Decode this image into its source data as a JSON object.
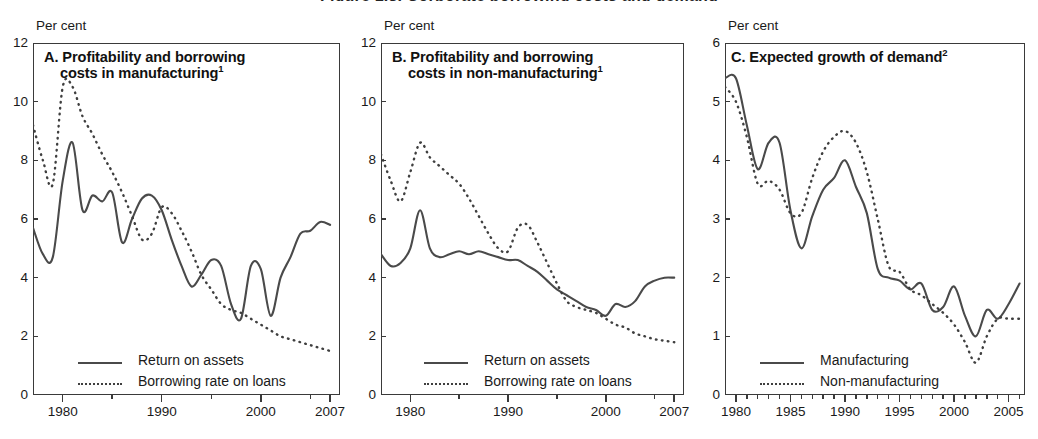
{
  "figure": {
    "cut_off_running_title": "Figure 1.8.  Corporate borrowing costs and demand",
    "units_label": "Per cent"
  },
  "panels": [
    {
      "id": "A",
      "title_line1": "A. Profitability and borrowing",
      "title_line2": "costs in manufacturing",
      "title_superscript": "1",
      "units": "Per cent",
      "y_ticks": [
        "0",
        "2",
        "4",
        "6",
        "8",
        "10",
        "12"
      ],
      "x_ticks": [
        "1980",
        "1990",
        "2000",
        "2007"
      ],
      "legend": [
        {
          "key": "solid",
          "label": "Return on assets"
        },
        {
          "key": "dotted",
          "label": "Borrowing rate on loans"
        }
      ]
    },
    {
      "id": "B",
      "title_line1": "B. Profitability and borrowing",
      "title_line2": "costs in non-manufacturing",
      "title_superscript": "1",
      "units": "Per cent",
      "y_ticks": [
        "0",
        "2",
        "4",
        "6",
        "8",
        "10",
        "12"
      ],
      "x_ticks": [
        "1980",
        "1990",
        "2000",
        "2007"
      ],
      "legend": [
        {
          "key": "solid",
          "label": "Return on assets"
        },
        {
          "key": "dotted",
          "label": "Borrowing rate on loans"
        }
      ]
    },
    {
      "id": "C",
      "title_line1": "C. Expected growth of demand",
      "title_line2": "",
      "title_superscript": "2",
      "units": "Per cent",
      "y_ticks": [
        "0",
        "1",
        "2",
        "3",
        "4",
        "5",
        "6"
      ],
      "x_ticks": [
        "1980",
        "1985",
        "1990",
        "1995",
        "2000",
        "2005"
      ],
      "legend": [
        {
          "key": "solid",
          "label": "Manufacturing"
        },
        {
          "key": "dotted",
          "label": "Non-manufacturing"
        }
      ]
    }
  ],
  "chart_data": [
    {
      "type": "line",
      "panel": "A",
      "title": "A. Profitability and borrowing costs in manufacturing",
      "xlabel": "",
      "ylabel": "Per cent",
      "ylim": [
        0,
        12
      ],
      "xlim": [
        1977,
        2008
      ],
      "grid": false,
      "legend_position": "bottom-left",
      "x": [
        1977,
        1978,
        1979,
        1980,
        1981,
        1982,
        1983,
        1984,
        1985,
        1986,
        1987,
        1988,
        1989,
        1990,
        1991,
        1992,
        1993,
        1994,
        1995,
        1996,
        1997,
        1998,
        1999,
        2000,
        2001,
        2002,
        2003,
        2004,
        2005,
        2006,
        2007
      ],
      "series": [
        {
          "name": "Return on assets",
          "style": "solid",
          "values": [
            5.7,
            4.8,
            4.7,
            7.3,
            8.6,
            6.3,
            6.8,
            6.6,
            6.9,
            5.2,
            6.0,
            6.7,
            6.8,
            6.3,
            5.3,
            4.4,
            3.7,
            4.1,
            4.6,
            4.4,
            3.1,
            2.6,
            4.4,
            4.3,
            2.7,
            4.0,
            4.7,
            5.5,
            5.6,
            5.9,
            5.8
          ]
        },
        {
          "name": "Borrowing rate on loans",
          "style": "dotted",
          "values": [
            9.2,
            8.0,
            7.2,
            10.5,
            10.5,
            9.5,
            8.9,
            8.2,
            7.6,
            6.9,
            6.1,
            5.3,
            5.5,
            6.4,
            6.2,
            5.6,
            4.9,
            4.1,
            3.6,
            3.1,
            2.9,
            2.8,
            2.6,
            2.4,
            2.2,
            2.0,
            1.9,
            1.8,
            1.7,
            1.6,
            1.5
          ]
        }
      ]
    },
    {
      "type": "line",
      "panel": "B",
      "title": "B. Profitability and borrowing costs in non-manufacturing",
      "xlabel": "",
      "ylabel": "Per cent",
      "ylim": [
        0,
        12
      ],
      "xlim": [
        1977,
        2008
      ],
      "grid": false,
      "legend_position": "bottom-left",
      "x": [
        1977,
        1978,
        1979,
        1980,
        1981,
        1982,
        1983,
        1984,
        1985,
        1986,
        1987,
        1988,
        1989,
        1990,
        1991,
        1992,
        1993,
        1994,
        1995,
        1996,
        1997,
        1998,
        1999,
        2000,
        2001,
        2002,
        2003,
        2004,
        2005,
        2006,
        2007
      ],
      "series": [
        {
          "name": "Return on assets",
          "style": "solid",
          "values": [
            4.8,
            4.4,
            4.5,
            5.0,
            6.3,
            5.0,
            4.7,
            4.8,
            4.9,
            4.8,
            4.9,
            4.8,
            4.7,
            4.6,
            4.6,
            4.4,
            4.2,
            3.9,
            3.6,
            3.4,
            3.2,
            3.0,
            2.9,
            2.7,
            3.1,
            3.0,
            3.2,
            3.7,
            3.9,
            4.0,
            4.0
          ]
        },
        {
          "name": "Borrowing rate on loans",
          "style": "dotted",
          "values": [
            8.2,
            7.3,
            6.6,
            7.6,
            8.6,
            8.1,
            7.8,
            7.5,
            7.2,
            6.7,
            6.1,
            5.5,
            5.0,
            4.9,
            5.7,
            5.8,
            5.2,
            4.5,
            3.8,
            3.2,
            3.0,
            2.9,
            2.8,
            2.6,
            2.4,
            2.3,
            2.1,
            2.0,
            1.9,
            1.85,
            1.8
          ]
        }
      ]
    },
    {
      "type": "line",
      "panel": "C",
      "title": "C. Expected growth of demand",
      "xlabel": "",
      "ylabel": "Per cent",
      "ylim": [
        0,
        6
      ],
      "xlim": [
        1979,
        2006.5
      ],
      "grid": false,
      "legend_position": "bottom-left",
      "x": [
        1979,
        1980,
        1981,
        1982,
        1983,
        1984,
        1985,
        1986,
        1987,
        1988,
        1989,
        1990,
        1991,
        1992,
        1993,
        1994,
        1995,
        1996,
        1997,
        1998,
        1999,
        2000,
        2001,
        2002,
        2003,
        2004,
        2005,
        2006
      ],
      "series": [
        {
          "name": "Manufacturing",
          "style": "solid",
          "values": [
            5.4,
            5.4,
            4.6,
            3.85,
            4.3,
            4.3,
            3.15,
            2.5,
            3.05,
            3.5,
            3.7,
            4.0,
            3.55,
            3.1,
            2.15,
            2.0,
            1.95,
            1.8,
            1.9,
            1.45,
            1.5,
            1.85,
            1.35,
            1.0,
            1.45,
            1.3,
            1.55,
            1.9
          ]
        },
        {
          "name": "Non-manufacturing",
          "style": "dotted",
          "values": [
            5.25,
            5.0,
            4.4,
            3.6,
            3.65,
            3.5,
            3.1,
            3.1,
            3.7,
            4.15,
            4.4,
            4.5,
            4.3,
            3.8,
            3.0,
            2.2,
            2.1,
            1.8,
            1.7,
            1.55,
            1.4,
            1.2,
            0.9,
            0.55,
            1.0,
            1.3,
            1.3,
            1.3
          ]
        }
      ]
    }
  ]
}
